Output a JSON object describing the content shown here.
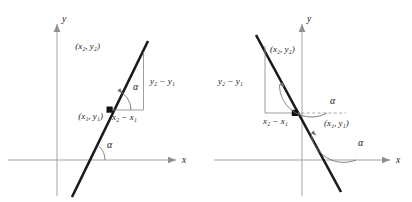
{
  "figure": {
    "axis_color": "#9a9a9a",
    "line_color": "#1a1a1a",
    "background": "#ffffff"
  },
  "panels": [
    {
      "id": "left",
      "description": "Line with positive slope and acute angle of inclination alpha",
      "slope_sign": "positive",
      "axes": {
        "x_label": "x",
        "y_label": "y"
      },
      "labels": {
        "point2": "(x₂, y₂)",
        "point1": "(x₁, y₁)",
        "rise": "y₂ − y₁",
        "run": "x₂ − x₁",
        "angle_at_point": "α",
        "angle_at_axis": "α"
      }
    },
    {
      "id": "right",
      "description": "Line with negative slope and obtuse angle of inclination alpha",
      "slope_sign": "negative",
      "axes": {
        "x_label": "x",
        "y_label": "y"
      },
      "labels": {
        "point2": "(x₂, y₂)",
        "point1": "(x₁, y₁)",
        "rise": "y₂ − y₁",
        "run": "x₂ − x₁",
        "angle_at_point": "α",
        "angle_at_axis": "α"
      }
    }
  ]
}
